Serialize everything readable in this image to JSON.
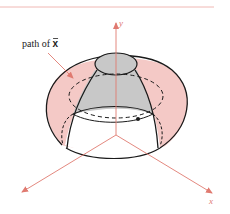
{
  "figure": {
    "annotation": "path of ",
    "annotation_vector": "x",
    "axes": {
      "y_label": "y",
      "x_label": "x"
    },
    "colors": {
      "surface_fill": "#f4c9c6",
      "cone_fill": "#c8c8c8",
      "axis": "#e07a70",
      "outline": "#1a1a1a",
      "rule": "#f0b8b4"
    }
  }
}
